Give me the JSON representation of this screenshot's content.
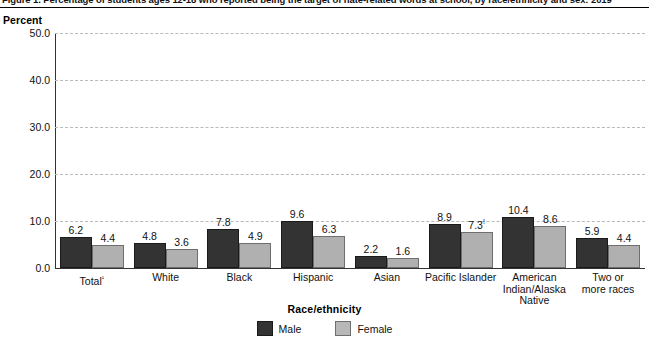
{
  "figure": {
    "caption": "Figure 1. Percentage of students ages 12-18 who reported being the target of hate-related words at school, by race/ethnicity and sex: 2019",
    "y_axis_unit_label": "Percent",
    "x_axis_title": "Race/ethnicity"
  },
  "legend": {
    "items": [
      {
        "label": "Male",
        "color": "#333333",
        "swatch": "male"
      },
      {
        "label": "Female",
        "color": "#b8b8b8",
        "swatch": "female"
      }
    ]
  },
  "chart_data": {
    "type": "bar",
    "title": "Percentage of students ages 12-18 who reported being the target of hate-related words at school, by race/ethnicity and sex: 2019",
    "xlabel": "Race/ethnicity",
    "ylabel": "Percent",
    "ylim": [
      0,
      50
    ],
    "yticks": [
      "0.0",
      "10.0",
      "20.0",
      "30.0",
      "40.0",
      "50.0"
    ],
    "ytick_values": [
      0,
      10,
      20,
      30,
      40,
      50
    ],
    "grid": true,
    "legend_position": "bottom-center",
    "categories": [
      "Total¹",
      "White",
      "Black",
      "Hispanic",
      "Asian",
      "Pacific Islander",
      "American Indian/Alaska Native",
      "Two or more races"
    ],
    "category_lines": [
      [
        "Total¹"
      ],
      [
        "White"
      ],
      [
        "Black"
      ],
      [
        "Hispanic"
      ],
      [
        "Asian"
      ],
      [
        "Pacific Islander"
      ],
      [
        "American",
        "Indian/Alaska",
        "Native"
      ],
      [
        "Two or",
        "more races"
      ]
    ],
    "series": [
      {
        "name": "Male",
        "color": "#333333",
        "values": [
          6.2,
          4.8,
          7.8,
          9.6,
          2.2,
          8.9,
          10.4,
          5.9
        ],
        "labels": [
          "6.2",
          "4.8",
          "7.8",
          "9.6",
          "2.2",
          "8.9",
          "10.4",
          "5.9"
        ],
        "label_markers": [
          "",
          "",
          "",
          "",
          "",
          "",
          "",
          ""
        ]
      },
      {
        "name": "Female",
        "color": "#b0b0b0",
        "values": [
          4.4,
          3.6,
          4.9,
          6.3,
          1.6,
          7.3,
          8.6,
          4.4
        ],
        "labels": [
          "4.4",
          "3.6",
          "4.9",
          "6.3",
          "1.6",
          "7.3",
          "8.6",
          "4.4"
        ],
        "label_markers": [
          "",
          "",
          "",
          "",
          "",
          "!",
          "",
          ""
        ]
      }
    ]
  }
}
